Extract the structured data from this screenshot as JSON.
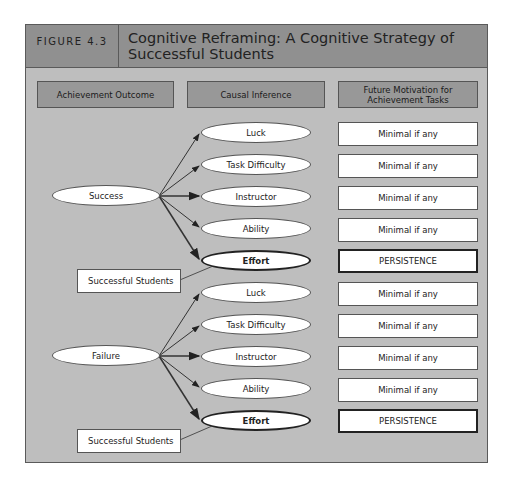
{
  "figure": {
    "label": "FIGURE 4.3",
    "title": "Cognitive Reframing: A Cognitive Strategy of Successful Students"
  },
  "columns": [
    {
      "label": "Achievement Outcome"
    },
    {
      "label": "Causal Inference"
    },
    {
      "label": "Future Motivation for Achievement Tasks"
    }
  ],
  "groups": [
    {
      "outcome": "Success",
      "annotation": "Successful Students",
      "inferences": [
        {
          "cause": "Luck",
          "motivation": "Minimal if any"
        },
        {
          "cause": "Task Difficulty",
          "motivation": "Minimal if any"
        },
        {
          "cause": "Instructor",
          "motivation": "Minimal if any"
        },
        {
          "cause": "Ability",
          "motivation": "Minimal if any"
        },
        {
          "cause": "Effort",
          "motivation": "PERSISTENCE",
          "emphasized": true
        }
      ]
    },
    {
      "outcome": "Failure",
      "annotation": "Successful Students",
      "inferences": [
        {
          "cause": "Luck",
          "motivation": "Minimal if any"
        },
        {
          "cause": "Task Difficulty",
          "motivation": "Minimal if any"
        },
        {
          "cause": "Instructor",
          "motivation": "Minimal if any"
        },
        {
          "cause": "Ability",
          "motivation": "Minimal if any"
        },
        {
          "cause": "Effort",
          "motivation": "PERSISTENCE",
          "emphasized": true
        }
      ]
    }
  ],
  "colors": {
    "header_band": "#909090",
    "body": "#bebebe",
    "column_header": "#989898",
    "node_fill": "#ffffff",
    "stroke": "#222222"
  }
}
